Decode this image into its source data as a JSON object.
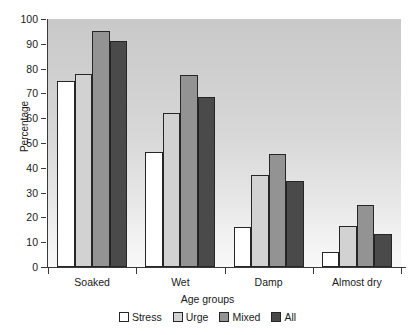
{
  "chart_data": {
    "type": "bar",
    "title": "",
    "xlabel": "Age groups",
    "ylabel": "Percentage",
    "categories": [
      "Soaked",
      "Wet",
      "Damp",
      "Almost dry"
    ],
    "series": [
      {
        "name": "Stress",
        "color": "#ffffff",
        "values": [
          75,
          46.5,
          16,
          6
        ]
      },
      {
        "name": "Urge",
        "color": "#d2d2d2",
        "values": [
          78,
          62,
          37,
          16.5
        ]
      },
      {
        "name": "Mixed",
        "color": "#939393",
        "values": [
          95,
          77.5,
          45.5,
          25
        ]
      },
      {
        "name": "All",
        "color": "#4a4a4a",
        "values": [
          91,
          68.5,
          34.5,
          13.5
        ]
      }
    ],
    "ylim": [
      0,
      100
    ],
    "yticks": [
      0,
      10,
      20,
      30,
      40,
      50,
      60,
      70,
      80,
      90,
      100
    ],
    "ytick_labels": [
      "0",
      "10",
      "20",
      "30",
      "40",
      "50",
      "60",
      "70",
      "80",
      "90",
      "100"
    ],
    "grid": false,
    "legend_position": "bottom",
    "plot_background": "#d8d8d8"
  }
}
